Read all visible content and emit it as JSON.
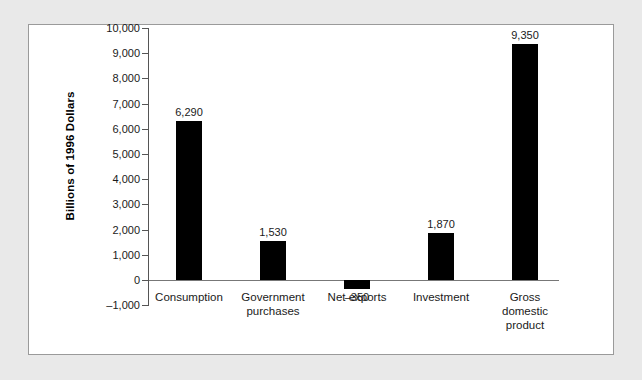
{
  "chart_data": {
    "type": "bar",
    "title": "",
    "xlabel": "",
    "ylabel": "Billions of 1996 Dollars",
    "ylim": [
      -1000,
      10000
    ],
    "grid": false,
    "legend": "none",
    "orientation": "vertical",
    "bar_color": "#000000",
    "categories": [
      "Consumption",
      "Government purchases",
      "Net exports",
      "Investment",
      "Gross domestic product"
    ],
    "values": [
      6290,
      1530,
      -350,
      1870,
      9350
    ],
    "value_labels": [
      "6,290",
      "1,530",
      "–350",
      "1,870",
      "9,350"
    ],
    "category_label_lines": [
      [
        "Consumption"
      ],
      [
        "Government",
        "purchases"
      ],
      [
        "Net exports"
      ],
      [
        "Investment"
      ],
      [
        "Gross",
        "domestic",
        "product"
      ]
    ],
    "ytick_values": [
      10000,
      9000,
      8000,
      7000,
      6000,
      5000,
      4000,
      3000,
      2000,
      1000,
      0,
      -1000
    ],
    "ytick_labels": [
      "10,000",
      "9,000",
      "8,000",
      "7,000",
      "6,000",
      "5,000",
      "4,000",
      "3,000",
      "2,000",
      "1,000",
      "0",
      "–1,000"
    ]
  }
}
